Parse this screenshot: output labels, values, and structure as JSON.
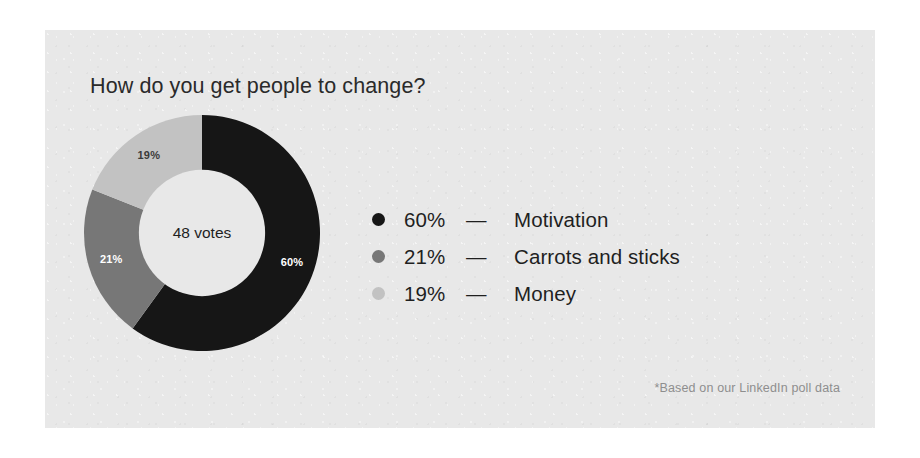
{
  "card": {
    "background_color": "#e8e8e8",
    "page_background_color": "#ffffff"
  },
  "chart_title": "How do you get people to change?",
  "donut": {
    "center_label": "48 votes",
    "center_label_color": "#1f1f1f",
    "hole_color": "#e8e8e8"
  },
  "legend": {
    "dash": "—",
    "rows": [
      {
        "bullet": "legend-bullet-motivation",
        "percent": "60%",
        "label": "Motivation",
        "color": "#161616"
      },
      {
        "bullet": "legend-bullet-carrots-and-sticks",
        "percent": "21%",
        "label": "Carrots and sticks",
        "color": "#777777"
      },
      {
        "bullet": "legend-bullet-money",
        "percent": "19%",
        "label": "Money",
        "color": "#c2c2c2"
      }
    ]
  },
  "footnote": "*Based on our LinkedIn poll data",
  "chart_data": {
    "type": "pie",
    "variant": "donut",
    "title": "How do you get people to change?",
    "subtitle": "",
    "xlabel": "",
    "ylabel": "",
    "total_label": "48 votes",
    "total_votes": 48,
    "units": "percent",
    "start_angle_deg": 0,
    "direction": "clockwise",
    "inner_radius_ratio": 0.535,
    "legend": "right",
    "grid": false,
    "annotations": [
      "*Based on our LinkedIn poll data"
    ],
    "categories": [
      "Motivation",
      "Carrots and sticks",
      "Money"
    ],
    "values": [
      60,
      21,
      19
    ],
    "slice_labels": [
      "60%",
      "21%",
      "19%"
    ],
    "colors": [
      "#161616",
      "#777777",
      "#c2c2c2"
    ],
    "slice_label_colors": [
      "#ffffff",
      "#ffffff",
      "#3a3a3a"
    ],
    "slices": [
      {
        "name": "Motivation",
        "value": 60,
        "label": "60%",
        "color": "#161616",
        "start_deg": 0,
        "end_deg": 216
      },
      {
        "name": "Carrots and sticks",
        "value": 21,
        "label": "21%",
        "color": "#777777",
        "start_deg": 216,
        "end_deg": 291.6
      },
      {
        "name": "Money",
        "value": 19,
        "label": "19%",
        "color": "#c2c2c2",
        "start_deg": 291.6,
        "end_deg": 360
      }
    ]
  }
}
